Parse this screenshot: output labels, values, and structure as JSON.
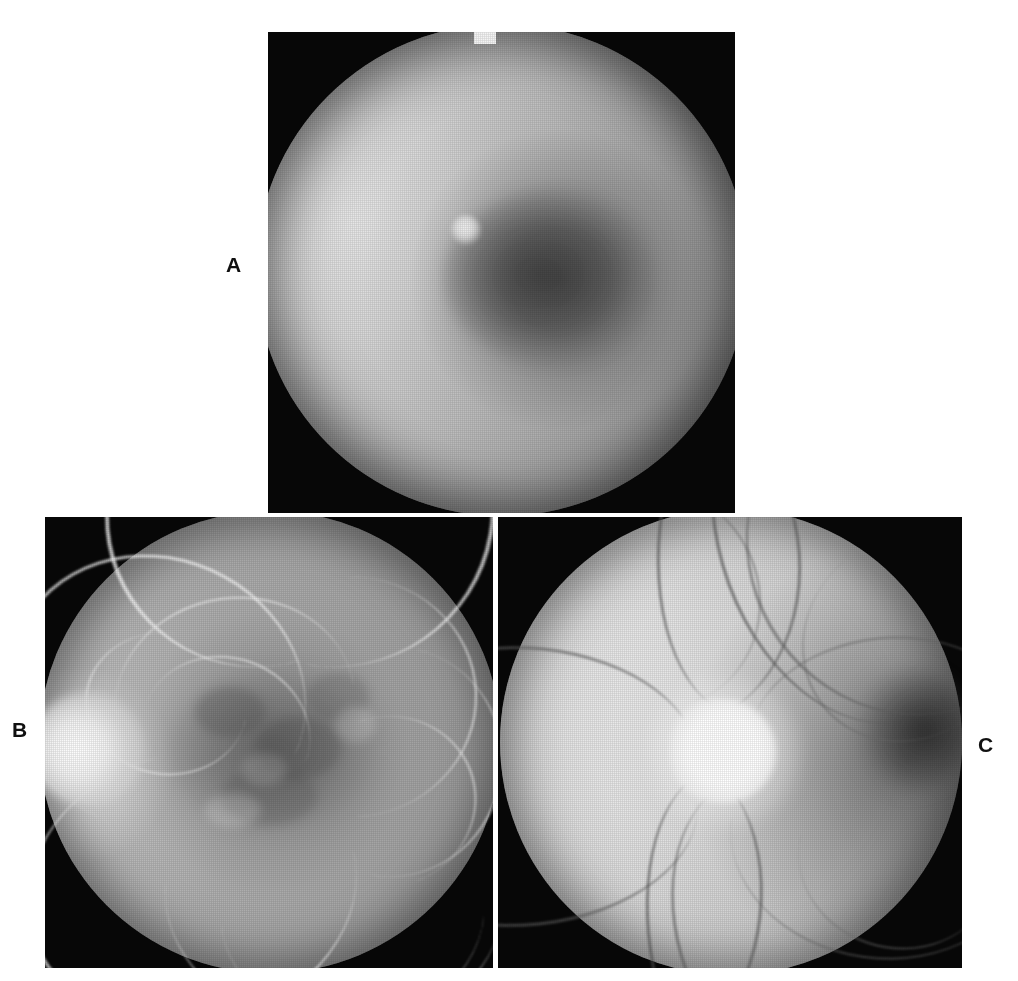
{
  "figure": {
    "background_color": "#ffffff",
    "width": 1018,
    "height": 981,
    "panel_count": 3
  },
  "panels": [
    {
      "label": "A",
      "name": "colour-fundus-photograph",
      "modality": "color fundus photograph",
      "frame_color": "#070707",
      "label_position": {
        "x": 226,
        "y": 254
      },
      "bounds": {
        "x": 268,
        "y": 32,
        "width": 467,
        "height": 481
      },
      "features": [
        "circular fundus field filling frame",
        "bright nasal retina upper-left",
        "dark macular lesion centre-right",
        "small bright round lesion within macula",
        "retinal vessels arcing across superior and inferior retina",
        "small white notch at top edge of frame"
      ]
    },
    {
      "label": "B",
      "name": "fluorescein-angiogram",
      "modality": "fluorescein angiogram",
      "frame_color": "#070707",
      "label_position": {
        "x": 12,
        "y": 719
      },
      "bounds": {
        "x": 45,
        "y": 517,
        "width": 448,
        "height": 451
      },
      "features": [
        "hyperfluorescent optic disc at left margin",
        "bright white retinal vessel tree",
        "mottled hypofluorescent macula in centre",
        "mid-grey choroidal background fluorescence"
      ]
    },
    {
      "label": "C",
      "name": "optic-disc-photograph",
      "modality": "color fundus photograph of optic disc",
      "frame_color": "#070707",
      "label_position": {
        "x": 978,
        "y": 734
      },
      "bounds": {
        "x": 498,
        "y": 517,
        "width": 464,
        "height": 451
      },
      "features": [
        "markedly pale bright optic disc left of centre",
        "dark retinal vessels radiating from disc",
        "dark macular region at right margin",
        "pale surrounding retina"
      ]
    }
  ],
  "colors": {
    "page_background": "#ffffff",
    "panel_frame": "#070707",
    "label_text": "#101010",
    "fundus_mid_grey": "#b2b2b2",
    "fundus_highlight": "#ffffff",
    "vessel_dark": "#4a4a4a"
  }
}
